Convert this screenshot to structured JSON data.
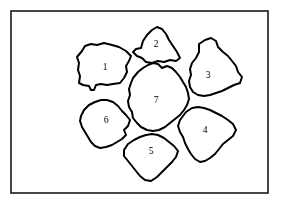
{
  "figure": {
    "type": "line-diagram",
    "background_color": "#ffffff",
    "line_color": "#000000",
    "frame_color": "#1a1a1a",
    "frame": {
      "x": 11,
      "y": 11,
      "width": 257,
      "height": 182
    },
    "regions": [
      {
        "id": "region-1",
        "label": "1",
        "label_x": 105,
        "label_y": 68,
        "points": "82,51 85,46 91,44 97,45 104,43 112,45 119,47 126,51 131,56 129,61 126,66 127,72 124,78 120,83 113,84 107,85 101,84 96,85 94,90 91,90 89,86 83,85 79,83 80,76 78,70 79,63 77,57"
      },
      {
        "id": "region-2",
        "label": "2",
        "label_x": 156,
        "label_y": 45,
        "points": "141,48 143,41 147,35 152,30 157,27 162,29 166,34 169,40 173,46 177,52 180,58 176,61 170,60 164,62 158,61 152,63 146,62 142,58 137,56 133,52 136,49"
      },
      {
        "id": "region-3",
        "label": "3",
        "label_x": 208,
        "label_y": 76,
        "points": "199,44 205,40 211,38 216,41 218,47 223,52 228,56 232,61 236,66 238,72 242,77 240,83 234,85 228,88 222,91 216,93 210,95 204,96 198,95 193,92 190,87 189,81 191,75 190,69 192,63 196,58 199,52"
      },
      {
        "id": "region-4",
        "label": "4",
        "label_x": 205,
        "label_y": 131,
        "points": "186,112 192,108 198,107 204,108 210,110 216,113 222,116 228,120 233,124 236,130 233,136 228,140 223,144 219,149 215,154 210,158 205,161 200,162 195,159 191,154 188,149 185,143 183,137 180,132 178,126 180,120 183,116"
      },
      {
        "id": "region-5",
        "label": "5",
        "label_x": 151,
        "label_y": 152,
        "points": "124,150 128,144 134,140 140,137 146,135 152,134 158,135 164,138 169,142 174,146 178,151 176,157 172,162 167,167 162,172 157,177 151,181 145,180 140,176 136,171 132,166 128,161 124,156"
      },
      {
        "id": "region-6",
        "label": "6",
        "label_x": 106,
        "label_y": 121,
        "points": "81,116 84,110 89,105 95,102 101,100 107,100 113,102 118,106 122,111 126,115 130,120 128,126 124,130 126,135 122,139 117,142 112,145 106,147 100,148 95,146 91,142 88,137 85,132 82,127 80,121"
      },
      {
        "id": "region-7",
        "label": "7",
        "label_x": 156,
        "label_y": 101,
        "points": "133,78 138,72 143,68 148,65 153,63 158,64 162,68 167,66 172,68 176,72 180,77 183,82 186,87 188,93 189,99 187,105 184,110 180,115 175,119 170,123 165,127 159,130 153,131 147,130 141,127 137,123 133,118 132,112 129,107 128,101 130,95 129,89 131,83"
      }
    ]
  }
}
